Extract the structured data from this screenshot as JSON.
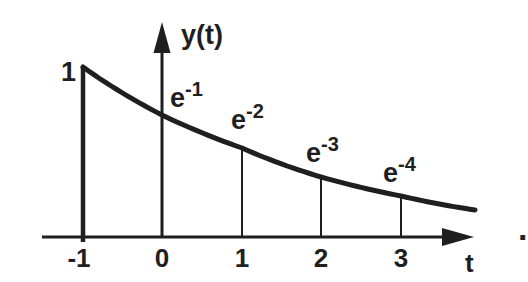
{
  "figure": {
    "trailing_period": "."
  },
  "chart_data": {
    "type": "line",
    "curve_function": "y(t) = e^-(t+1)",
    "xlabel": "t",
    "ylabel": "y(t)",
    "x_ticks": [
      "-1",
      "0",
      "1",
      "2",
      "3"
    ],
    "x_tick_values": [
      -1,
      0,
      1,
      2,
      3
    ],
    "points": [
      {
        "t": -1,
        "value": 1.0,
        "label_base": "1",
        "label_exp": ""
      },
      {
        "t": 0,
        "value": 0.3679,
        "label_base": "e",
        "label_exp": "-1"
      },
      {
        "t": 1,
        "value": 0.1353,
        "label_base": "e",
        "label_exp": "-2"
      },
      {
        "t": 2,
        "value": 0.0498,
        "label_base": "e",
        "label_exp": "-3"
      },
      {
        "t": 3,
        "value": 0.0183,
        "label_base": "e",
        "label_exp": "-4"
      }
    ],
    "xlim": [
      -1.5,
      4.0
    ],
    "ylim": [
      0,
      1.3
    ],
    "grid": false,
    "legend": false,
    "layout_px": {
      "width": 528,
      "height": 282,
      "stroke_color": "#1f1f1f",
      "baseline_y": 237,
      "x_axis": {
        "x1": 42,
        "x2": 446,
        "arrow_tip_x": 474,
        "arrow_len": 32,
        "arrow_half": 9,
        "width": 3
      },
      "y_axis": {
        "x": 162,
        "top_y": 51,
        "arrow_tip_y": 22,
        "arrow_len": 31,
        "arrow_half": 8.5,
        "width": 3
      },
      "spike": {
        "x": 83,
        "y_top": 67,
        "y_bottom": 242,
        "width": 4.5
      },
      "verticals": [
        {
          "x": 242,
          "y_top": 149
        },
        {
          "x": 321,
          "y_top": 178
        },
        {
          "x": 401,
          "y_top": 196
        }
      ],
      "vertical_width": 2,
      "curve_anchors": [
        [
          83,
          67
        ],
        [
          162,
          115
        ],
        [
          242,
          148
        ],
        [
          321,
          177
        ],
        [
          401,
          196
        ],
        [
          475,
          210
        ]
      ],
      "curve_width": 5,
      "tick_label_x": [
        79,
        162,
        242,
        321,
        401
      ],
      "tick_label_y": 245,
      "point_label_pos": [
        [
          61,
          59
        ],
        [
          170,
          85
        ],
        [
          231,
          107
        ],
        [
          306,
          140
        ],
        [
          383,
          160
        ]
      ]
    }
  }
}
